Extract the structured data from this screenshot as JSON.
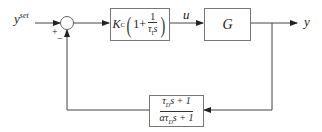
{
  "diagram": {
    "type": "feedback-control-block-diagram",
    "input_label": "y",
    "input_sup": "set",
    "summing_junction": {
      "plus_sign": "+",
      "minus_sign": "−"
    },
    "controller_block": {
      "gain": "K",
      "gain_sub": "C",
      "one": "1",
      "plus": "+",
      "frac_num": "1",
      "frac_den_tau": "τ",
      "frac_den_sub": "I",
      "frac_den_s": "s"
    },
    "signal_u": "u",
    "plant_block": {
      "label": "G"
    },
    "output_label": "y",
    "feedback_block": {
      "num_tau": "τ",
      "num_sub": "D",
      "num_rest": "s + 1",
      "den_alpha": "α",
      "den_tau": "τ",
      "den_sub": "D",
      "den_rest": "s + 1"
    },
    "colors": {
      "line": "#444444",
      "block_border": "#777777",
      "background": "#ffffff"
    }
  }
}
